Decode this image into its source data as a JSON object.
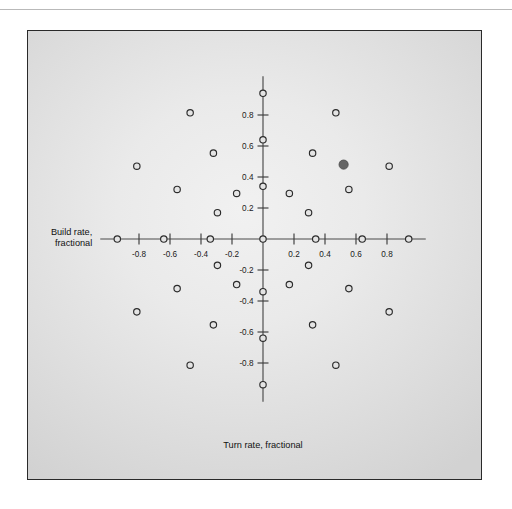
{
  "figure": {
    "panel_background_light": "#f1f1f1",
    "panel_background_dark": "#d2d2d2",
    "panel_border_color": "#2a2a2a",
    "top_rule_color": "#b9b9b9"
  },
  "labels": {
    "y_axis_line1": "Build rate,",
    "y_axis_line2": "fractional",
    "x_axis_title": "Turn rate, fractional"
  },
  "chart_data": {
    "type": "scatter",
    "title": "",
    "subtitle": "",
    "xlabel": "Turn rate, fractional",
    "ylabel": "Build rate, fractional",
    "xlim": [
      -1.05,
      1.05
    ],
    "ylim": [
      -1.05,
      1.05
    ],
    "grid": false,
    "legend": null,
    "axis_style": "crossed-axes-at-origin",
    "x_tick_labels": [
      "-0.8",
      "-0.6",
      "-0.4",
      "-0.2",
      "0.2",
      "0.4",
      "0.6",
      "0.8"
    ],
    "x_tick_values": [
      -0.8,
      -0.6,
      -0.4,
      -0.2,
      0.2,
      0.4,
      0.6,
      0.8
    ],
    "y_tick_labels": [
      "0.8",
      "0.6",
      "0.4",
      "0.2",
      "-0.2",
      "-0.4",
      "-0.6",
      "-0.8"
    ],
    "y_tick_values": [
      0.8,
      0.6,
      0.4,
      0.2,
      -0.2,
      -0.4,
      -0.6,
      -0.8
    ],
    "marker_style": "open-circle",
    "highlight_marker_style": "filled-circle",
    "highlight_color": "#656565",
    "marker_color": "#2b2b2b",
    "rings": [
      {
        "radius": 0.0,
        "count": 1
      },
      {
        "radius": 0.34,
        "count": 12
      },
      {
        "radius": 0.64,
        "count": 12
      },
      {
        "radius": 0.94,
        "count": 12
      }
    ],
    "angles_deg": [
      0,
      30,
      60,
      90,
      120,
      150,
      180,
      210,
      240,
      270,
      300,
      330
    ],
    "highlight_point": {
      "x": 0.52,
      "y": 0.48
    },
    "points": [
      {
        "x": 0.0,
        "y": 0.0
      },
      {
        "x": 0.34,
        "y": 0.0
      },
      {
        "x": 0.294,
        "y": 0.17
      },
      {
        "x": 0.17,
        "y": 0.294
      },
      {
        "x": 0.0,
        "y": 0.34
      },
      {
        "x": -0.17,
        "y": 0.294
      },
      {
        "x": -0.294,
        "y": 0.17
      },
      {
        "x": -0.34,
        "y": 0.0
      },
      {
        "x": -0.294,
        "y": -0.17
      },
      {
        "x": -0.17,
        "y": -0.294
      },
      {
        "x": 0.0,
        "y": -0.34
      },
      {
        "x": 0.17,
        "y": -0.294
      },
      {
        "x": 0.294,
        "y": -0.17
      },
      {
        "x": 0.64,
        "y": 0.0
      },
      {
        "x": 0.554,
        "y": 0.32
      },
      {
        "x": 0.32,
        "y": 0.554
      },
      {
        "x": 0.0,
        "y": 0.64
      },
      {
        "x": -0.32,
        "y": 0.554
      },
      {
        "x": -0.554,
        "y": 0.32
      },
      {
        "x": -0.64,
        "y": 0.0
      },
      {
        "x": -0.554,
        "y": -0.32
      },
      {
        "x": -0.32,
        "y": -0.554
      },
      {
        "x": 0.0,
        "y": -0.64
      },
      {
        "x": 0.32,
        "y": -0.554
      },
      {
        "x": 0.554,
        "y": -0.32
      },
      {
        "x": 0.94,
        "y": 0.0
      },
      {
        "x": 0.814,
        "y": 0.47
      },
      {
        "x": 0.47,
        "y": 0.814
      },
      {
        "x": 0.0,
        "y": 0.94
      },
      {
        "x": -0.47,
        "y": 0.814
      },
      {
        "x": -0.814,
        "y": 0.47
      },
      {
        "x": -0.94,
        "y": 0.0
      },
      {
        "x": -0.814,
        "y": -0.47
      },
      {
        "x": -0.47,
        "y": -0.814
      },
      {
        "x": 0.0,
        "y": -0.94
      },
      {
        "x": 0.47,
        "y": -0.814
      },
      {
        "x": 0.814,
        "y": -0.47
      }
    ]
  }
}
